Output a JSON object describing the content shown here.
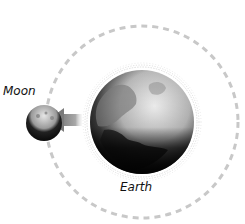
{
  "diagram": {
    "type": "orbit-diagram",
    "labels": {
      "moon": "Moon",
      "earth": "Earth"
    },
    "orbit": {
      "style": "dashed",
      "color": "#c8c8c8"
    },
    "arrow": {
      "direction": "toward-moon-from-earth",
      "color": "#8a8a8a"
    },
    "colors": {
      "earth_light": "#e8e8e8",
      "earth_dark": "#111111",
      "moon_light": "#d0d0d0",
      "moon_dark": "#1a1a1a",
      "glow": "#dcdcdc"
    }
  }
}
